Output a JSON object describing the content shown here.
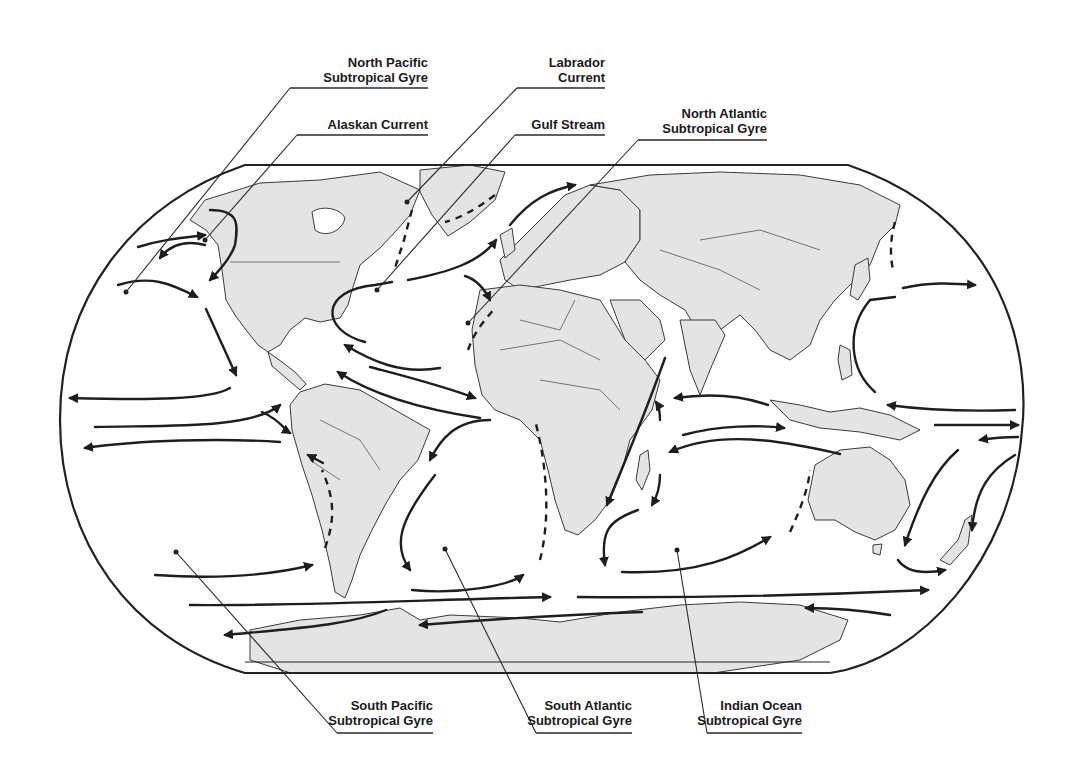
{
  "colors": {
    "land": "#e4e4e4",
    "outline": "#222222",
    "ocean": "#ffffff",
    "text": "#1a1a1a"
  },
  "labels": [
    {
      "id": "north-pacific-gyre",
      "line1": "North Pacific",
      "line2": "Subtropical Gyre",
      "x": 230,
      "y": 46,
      "w": 172,
      "point": [
        126,
        292
      ],
      "elbow": [
        290,
        88
      ]
    },
    {
      "id": "alaskan-current",
      "line1": "Alaskan Current",
      "line2": "",
      "x": 230,
      "y": 117,
      "w": 172,
      "point": [
        205,
        240
      ],
      "elbow": [
        297,
        135
      ]
    },
    {
      "id": "labrador-current",
      "line1": "Labrador",
      "line2": "Current",
      "x": 530,
      "y": 52,
      "w": 53,
      "point": [
        407,
        202
      ],
      "elbow": [
        517,
        88
      ]
    },
    {
      "id": "gulf-stream",
      "line1": "Gulf Stream",
      "line2": "",
      "x": 470,
      "y": 117,
      "w": 113,
      "point": [
        377,
        290
      ],
      "elbow": [
        515,
        135
      ]
    },
    {
      "id": "north-atlantic-gyre",
      "line1": "North Atlantic",
      "line2": "Subtropical Gyre",
      "x": 640,
      "y": 103,
      "w": 125,
      "point": [
        468,
        323
      ],
      "elbow": [
        638,
        140
      ]
    },
    {
      "id": "south-pacific-gyre",
      "line1": "South Pacific",
      "line2": "Subtropical Gyre",
      "x": 345,
      "y": 692,
      "w": 88,
      "point": [
        176,
        552
      ],
      "elbow": [
        337,
        733
      ]
    },
    {
      "id": "south-atlantic-gyre",
      "line1": "South Atlantic",
      "line2": "Subtropical Gyre",
      "x": 540,
      "y": 692,
      "w": 92,
      "point": [
        445,
        549
      ],
      "elbow": [
        536,
        733
      ]
    },
    {
      "id": "indian-ocean-gyre",
      "line1": "Indian Ocean",
      "line2": "Subtropical Gyre",
      "x": 710,
      "y": 692,
      "w": 92,
      "point": [
        677,
        550
      ],
      "elbow": [
        707,
        733
      ]
    }
  ]
}
